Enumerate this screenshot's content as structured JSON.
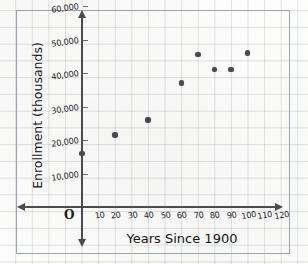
{
  "figure": {
    "kind": "hand-drawn-scatter-plot-on-graph-paper",
    "origin_label": "O"
  },
  "chart_data": {
    "type": "scatter",
    "title": "",
    "xlabel": "Years Since 1900",
    "ylabel": "Enrollment (thousands)",
    "xlim": [
      0,
      125
    ],
    "ylim": [
      0,
      63000
    ],
    "grid": true,
    "legend": "none",
    "xticks": [
      10,
      20,
      30,
      40,
      50,
      60,
      70,
      80,
      90,
      100,
      110,
      120
    ],
    "xtick_labels": [
      "10",
      "20",
      "30",
      "40",
      "50",
      "60",
      "70",
      "80",
      "90",
      "100",
      "110",
      "120"
    ],
    "yticks": [
      10000,
      20000,
      30000,
      40000,
      50000,
      60000
    ],
    "ytick_labels": [
      "10,000",
      "20,000",
      "30,000",
      "40,000",
      "50,000",
      "60,000"
    ],
    "x": [
      0,
      20,
      40,
      60,
      70,
      80,
      90,
      100
    ],
    "y": [
      16000,
      21500,
      26000,
      37000,
      45500,
      41000,
      41000,
      46000
    ],
    "points": [
      {
        "x": 0,
        "y": 16000
      },
      {
        "x": 20,
        "y": 21500
      },
      {
        "x": 40,
        "y": 26000
      },
      {
        "x": 60,
        "y": 37000
      },
      {
        "x": 70,
        "y": 45500
      },
      {
        "x": 80,
        "y": 41000
      },
      {
        "x": 90,
        "y": 41000
      },
      {
        "x": 100,
        "y": 46000
      }
    ],
    "marker_color": "#4a4a52",
    "axis_color": "#4c4c50",
    "grid_color": "#96a0af"
  }
}
